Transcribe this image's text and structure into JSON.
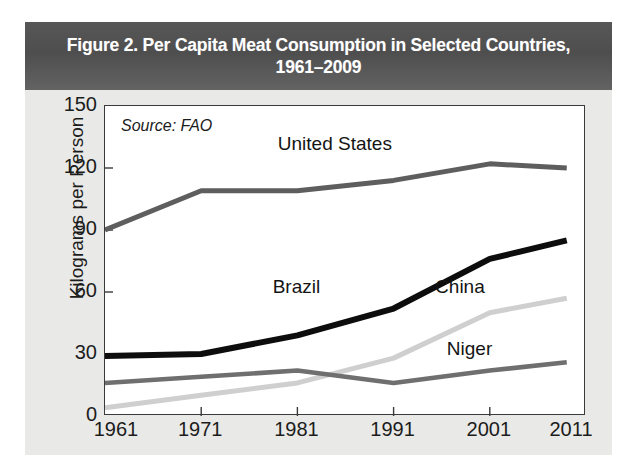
{
  "figure": {
    "title": "Figure 2. Per Capita Meat Consumption in Selected Countries, 1961–2009",
    "title_line1": "Figure 2. Per Capita Meat Consumption in Selected Countries,",
    "title_line2": "1961–2009",
    "source_note": "Source: FAO",
    "title_bar_color": "#575757",
    "background_color": "#e9e9e7",
    "plot_background_color": "#ffffff",
    "frame_color": "#3a3a3a"
  },
  "chart_data": {
    "type": "line",
    "title": "Figure 2. Per Capita Meat Consumption in Selected Countries, 1961–2009",
    "subtitle": "1961–2009",
    "xlabel": "",
    "ylabel": "Kilograms per Person",
    "source": "Source: FAO",
    "xlim": [
      1961,
      2011
    ],
    "ylim": [
      0,
      150
    ],
    "xticks": [
      1961,
      1971,
      1981,
      1991,
      2001,
      2011
    ],
    "yticks": [
      0,
      30,
      60,
      90,
      120,
      150
    ],
    "grid": false,
    "legend": "inline-labels",
    "x": [
      1961,
      1971,
      1981,
      1991,
      2001,
      2009
    ],
    "series": [
      {
        "name": "United States",
        "color": "#5e5e5e",
        "values": [
          90,
          109,
          109,
          114,
          122,
          120
        ],
        "label_x": 1985,
        "label_y": 131
      },
      {
        "name": "Brazil",
        "color": "#0d0d0d",
        "values": [
          29,
          30,
          39,
          52,
          76,
          85
        ],
        "label_x": 1981,
        "label_y": 62
      },
      {
        "name": "China",
        "color": "#cfcfcf",
        "values": [
          4,
          10,
          16,
          28,
          50,
          57
        ],
        "label_x": 1998,
        "label_y": 62
      },
      {
        "name": "Niger",
        "color": "#6f6f6f",
        "values": [
          16,
          19,
          22,
          16,
          22,
          26
        ],
        "label_x": 1999,
        "label_y": 32
      }
    ]
  },
  "axis": {
    "y_title": "Kilograms per Person",
    "y_tick_labels": [
      "150",
      "120",
      "90",
      "60",
      "30",
      "0"
    ],
    "x_tick_labels": [
      "1961",
      "1971",
      "1981",
      "1991",
      "2001",
      "2011"
    ]
  },
  "series_labels": {
    "united_states": "United States",
    "brazil": "Brazil",
    "china": "China",
    "niger": "Niger"
  }
}
